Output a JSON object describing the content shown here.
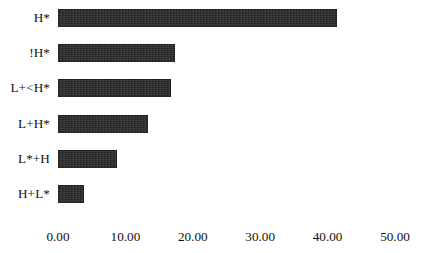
{
  "chart_data": {
    "type": "bar",
    "orientation": "horizontal",
    "title": "",
    "subtitle": "",
    "xlabel": "",
    "ylabel": "",
    "categories": [
      "H*",
      "!H*",
      "L+<H*",
      "L+H*",
      "L*+H",
      "H+L*"
    ],
    "values": [
      41.4,
      17.4,
      16.8,
      13.3,
      8.8,
      3.9
    ],
    "series": [
      {
        "name": "",
        "values": [
          41.4,
          17.4,
          16.8,
          13.3,
          8.8,
          3.9
        ]
      }
    ],
    "xlim": [
      0,
      50
    ],
    "xticks": [
      0,
      10,
      20,
      30,
      40,
      50
    ],
    "xtick_labels": [
      "0.00",
      "10.00",
      "20.00",
      "30.00",
      "40.00",
      "50.00"
    ],
    "ytick_labels": [
      "H*",
      "!H*",
      "L+<H*",
      "L+H*",
      "L*+H",
      "H+L*"
    ],
    "grid": false,
    "legend": false,
    "legend_position": "none",
    "bar_color": "#2b2b2b",
    "background_color": "#ffffff",
    "annotations": []
  },
  "axis": {
    "x_min_value": 0,
    "x_max_value": 50,
    "tick_labels": [
      "0.00",
      "10.00",
      "20.00",
      "30.00",
      "40.00",
      "50.00"
    ]
  },
  "bars": [
    {
      "label": "H*",
      "value": 41.4
    },
    {
      "label": "!H*",
      "value": 17.4
    },
    {
      "label": "L+<H*",
      "value": 16.8
    },
    {
      "label": "L+H*",
      "value": 13.3
    },
    {
      "label": "L*+H",
      "value": 8.8
    },
    {
      "label": "H+L*",
      "value": 3.9
    }
  ]
}
